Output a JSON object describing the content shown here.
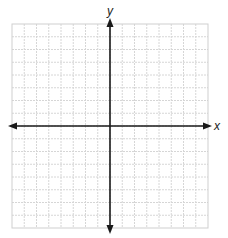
{
  "diagram": {
    "type": "coordinate-plane",
    "grid": {
      "columns": 16,
      "rows": 16,
      "left": 12,
      "top": 24,
      "right": 208,
      "bottom": 228,
      "line_color": "#d6d6d6",
      "border_color": "#cfcfcf"
    },
    "axes": {
      "color": "#1a1a1a",
      "x_label": "x",
      "y_label": "y",
      "origin_column": 8,
      "origin_row": 8,
      "x_axis_extent": [
        8,
        212
      ],
      "y_axis_extent": [
        18,
        234
      ]
    }
  }
}
